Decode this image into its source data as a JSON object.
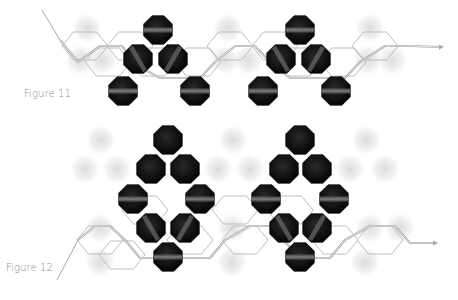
{
  "figures": [
    {
      "label": "Figure 11",
      "label_pos": [
        24,
        95
      ],
      "caption_line": [
        [
          42,
          10
        ],
        [
          60,
          40
        ]
      ],
      "hexes": [
        {
          "cx": 85,
          "cy": 46
        },
        {
          "cx": 130,
          "cy": 46
        },
        {
          "cx": 230,
          "cy": 46
        },
        {
          "cx": 275,
          "cy": 46
        },
        {
          "cx": 375,
          "cy": 46
        },
        {
          "cx": 108,
          "cy": 62
        },
        {
          "cx": 153,
          "cy": 62
        },
        {
          "cx": 198,
          "cy": 62
        },
        {
          "cx": 298,
          "cy": 62
        },
        {
          "cx": 343,
          "cy": 62
        }
      ],
      "strand_y": 46,
      "arrow_end": [
        444,
        47
      ],
      "dark_balls": [
        {
          "cx": 158,
          "cy": 30,
          "stripe": "h"
        },
        {
          "cx": 138,
          "cy": 59,
          "stripe": "d1"
        },
        {
          "cx": 173,
          "cy": 59,
          "stripe": "d2"
        },
        {
          "cx": 123,
          "cy": 91,
          "stripe": "h"
        },
        {
          "cx": 195,
          "cy": 91,
          "stripe": "h"
        },
        {
          "cx": 300,
          "cy": 30,
          "stripe": "h"
        },
        {
          "cx": 281,
          "cy": 59,
          "stripe": "d1"
        },
        {
          "cx": 316,
          "cy": 59,
          "stripe": "d2"
        },
        {
          "cx": 263,
          "cy": 91,
          "stripe": "h"
        },
        {
          "cx": 336,
          "cy": 91,
          "stripe": "h"
        }
      ],
      "ghost_balls": [
        {
          "cx": 87,
          "cy": 28
        },
        {
          "cx": 228,
          "cy": 28
        },
        {
          "cx": 370,
          "cy": 28
        },
        {
          "cx": 80,
          "cy": 60
        },
        {
          "cx": 102,
          "cy": 60
        },
        {
          "cx": 225,
          "cy": 60
        },
        {
          "cx": 248,
          "cy": 60
        },
        {
          "cx": 368,
          "cy": 60
        },
        {
          "cx": 392,
          "cy": 60
        }
      ]
    },
    {
      "label": "Figure 12",
      "label_pos": [
        6,
        269
      ],
      "caption_line": [
        [
          57,
          280
        ],
        [
          78,
          240
        ]
      ],
      "hexes": [
        {
          "cx": 100,
          "cy": 240
        },
        {
          "cx": 145,
          "cy": 210
        },
        {
          "cx": 190,
          "cy": 240
        },
        {
          "cx": 235,
          "cy": 210
        },
        {
          "cx": 245,
          "cy": 240
        },
        {
          "cx": 290,
          "cy": 210
        },
        {
          "cx": 335,
          "cy": 240
        },
        {
          "cx": 380,
          "cy": 240
        },
        {
          "cx": 122,
          "cy": 255
        }
      ],
      "strand_y": 243,
      "arrow_end": [
        438,
        243
      ],
      "dark_balls": [
        {
          "cx": 168,
          "cy": 140,
          "stripe": "none"
        },
        {
          "cx": 151,
          "cy": 169,
          "stripe": "none"
        },
        {
          "cx": 185,
          "cy": 169,
          "stripe": "none"
        },
        {
          "cx": 133,
          "cy": 199,
          "stripe": "h"
        },
        {
          "cx": 200,
          "cy": 199,
          "stripe": "h"
        },
        {
          "cx": 151,
          "cy": 228,
          "stripe": "d1"
        },
        {
          "cx": 185,
          "cy": 228,
          "stripe": "d2"
        },
        {
          "cx": 168,
          "cy": 257,
          "stripe": "h"
        },
        {
          "cx": 300,
          "cy": 140,
          "stripe": "none"
        },
        {
          "cx": 284,
          "cy": 169,
          "stripe": "none"
        },
        {
          "cx": 317,
          "cy": 169,
          "stripe": "none"
        },
        {
          "cx": 266,
          "cy": 199,
          "stripe": "h"
        },
        {
          "cx": 334,
          "cy": 199,
          "stripe": "h"
        },
        {
          "cx": 284,
          "cy": 228,
          "stripe": "d1"
        },
        {
          "cx": 317,
          "cy": 228,
          "stripe": "d2"
        },
        {
          "cx": 300,
          "cy": 257,
          "stripe": "h"
        }
      ],
      "ghost_balls": [
        {
          "cx": 101,
          "cy": 140
        },
        {
          "cx": 233,
          "cy": 140
        },
        {
          "cx": 366,
          "cy": 140
        },
        {
          "cx": 85,
          "cy": 169
        },
        {
          "cx": 117,
          "cy": 169
        },
        {
          "cx": 218,
          "cy": 169
        },
        {
          "cx": 250,
          "cy": 169
        },
        {
          "cx": 350,
          "cy": 169
        },
        {
          "cx": 385,
          "cy": 169
        },
        {
          "cx": 100,
          "cy": 228
        },
        {
          "cx": 232,
          "cy": 228
        },
        {
          "cx": 370,
          "cy": 228
        },
        {
          "cx": 400,
          "cy": 228
        },
        {
          "cx": 100,
          "cy": 262
        },
        {
          "cx": 232,
          "cy": 262
        },
        {
          "cx": 365,
          "cy": 262
        }
      ]
    }
  ],
  "colors": {
    "ball": "#0d0d0d",
    "ball_stripe": "#6b6b6b",
    "ghost": "#e6e6e6",
    "hex_line": "#bdbdbd",
    "strand": "#a8a8a8",
    "label": "#8a8a8a"
  }
}
